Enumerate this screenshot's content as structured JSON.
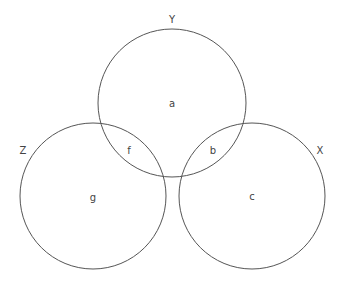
{
  "diagram": {
    "type": "venn",
    "stroke_color": "#555555",
    "text_color": "#444444",
    "sets": [
      {
        "id": "Y",
        "label": "Y",
        "cx": 172,
        "cy": 103,
        "r": 74,
        "label_x": 172,
        "label_y": 23
      },
      {
        "id": "Z",
        "label": "Z",
        "cx": 93,
        "cy": 196,
        "r": 73,
        "label_x": 23,
        "label_y": 154
      },
      {
        "id": "X",
        "label": "X",
        "cx": 252,
        "cy": 196,
        "r": 73,
        "label_x": 320,
        "label_y": 154
      }
    ],
    "regions": [
      {
        "label": "a",
        "x": 172,
        "y": 107
      },
      {
        "label": "f",
        "x": 129,
        "y": 154
      },
      {
        "label": "b",
        "x": 213,
        "y": 154
      },
      {
        "label": "g",
        "x": 93,
        "y": 201
      },
      {
        "label": "c",
        "x": 252,
        "y": 200
      }
    ]
  }
}
